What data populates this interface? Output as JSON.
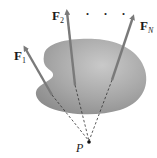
{
  "diagram": {
    "type": "concurrent-force-system",
    "body": {
      "shape": "irregular-rigid-body",
      "fill": "#9a9a9a"
    },
    "forces": [
      {
        "symbol": "F",
        "subscript": "1",
        "subscript_italic": false
      },
      {
        "symbol": "F",
        "subscript": "2",
        "subscript_italic": false
      },
      {
        "symbol": "F",
        "subscript": "N",
        "subscript_italic": true
      }
    ],
    "ellipsis": ". . .",
    "point": {
      "label": "P"
    },
    "colors": {
      "arrow": "#7a7a7a",
      "body": "#9a9a9a",
      "dash": "#333333",
      "text": "#1a1a1a"
    }
  }
}
